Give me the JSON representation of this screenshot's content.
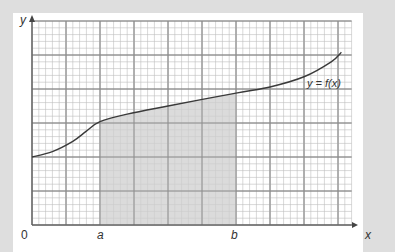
{
  "figure": {
    "y_axis_label": "y",
    "x_axis_label": "x",
    "origin_label": "0",
    "a_label": "a",
    "b_label": "b",
    "curve_label": "y = f(x)"
  },
  "style": {
    "background": "#dedede",
    "panel": "#ffffff",
    "grid_minor": "#bdbdbd",
    "grid_major": "#8c8c8c",
    "shade": "#cfcfcf",
    "curve": "#3a3a3a",
    "axis": "#555555"
  },
  "chart_data": {
    "type": "area",
    "title": "",
    "xlabel": "x",
    "ylabel": "y",
    "grid": true,
    "grid_cells_x": 47,
    "grid_cells_y": 30,
    "major_every": 5,
    "curve_points_grid_units": [
      [
        0,
        10
      ],
      [
        3,
        10.8
      ],
      [
        6,
        12.3
      ],
      [
        8,
        13.8
      ],
      [
        10,
        15.2
      ],
      [
        14,
        16.3
      ],
      [
        20,
        17.5
      ],
      [
        30,
        19.4
      ],
      [
        35,
        20.3
      ],
      [
        40,
        21.8
      ],
      [
        44,
        24
      ],
      [
        45.5,
        25.4
      ]
    ],
    "shaded_interval": {
      "from": "a",
      "to": "b",
      "a_grid": 10,
      "b_grid": 30
    },
    "annotations": [
      "0",
      "a",
      "b",
      "y = f(x)"
    ]
  }
}
